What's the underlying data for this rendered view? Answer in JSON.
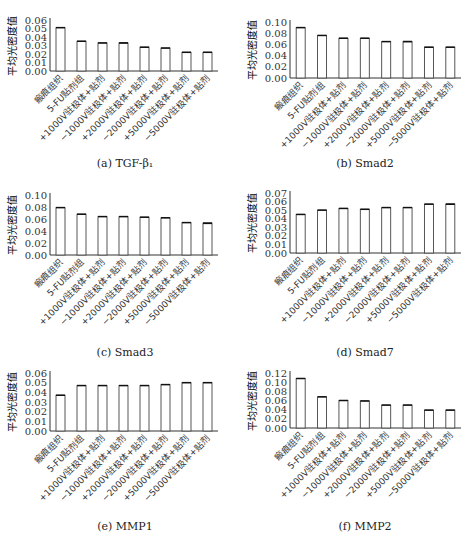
{
  "categories": [
    "瘢痕组织",
    "5-FU贴剂组",
    "+1000V驻极体+贴剂",
    "−1000V驻极体+贴剂",
    "+2000V驻极体+贴剂",
    "−2000V驻极体+贴剂",
    "+5000V驻极体+贴剂",
    "−5000V驻极体+贴剂"
  ],
  "ylabel": "平均光密度值",
  "captions": [
    "(a) TGF-β₁",
    "(b) Smad2",
    "(c) Smad3",
    "(d) Smad7",
    "(e) MMP1",
    "(f) MMP2"
  ],
  "chart_data": [
    {
      "type": "bar",
      "title": "(a) TGF-β1",
      "xlabel": "",
      "ylabel": "平均光密度值",
      "ylim": [
        0,
        0.06
      ],
      "yticks": [
        "0.00",
        "0.01",
        "0.02",
        "0.03",
        "0.04",
        "0.05",
        "0.06"
      ],
      "categories": [
        "瘢痕组织",
        "5-FU贴剂组",
        "+1000V驻极体+贴剂",
        "−1000V驻极体+贴剂",
        "+2000V驻极体+贴剂",
        "−2000V驻极体+贴剂",
        "+5000V驻极体+贴剂",
        "−5000V驻极体+贴剂"
      ],
      "values": [
        0.051,
        0.035,
        0.033,
        0.033,
        0.028,
        0.027,
        0.022,
        0.022
      ],
      "errors": [
        0.001,
        0.001,
        0.001,
        0.002,
        0.001,
        0.001,
        0.001,
        0.001
      ]
    },
    {
      "type": "bar",
      "title": "(b) Smad2",
      "xlabel": "",
      "ylabel": "平均光密度值",
      "ylim": [
        0,
        0.1
      ],
      "yticks": [
        "0.00",
        "0.02",
        "0.04",
        "0.06",
        "0.08",
        "0.10"
      ],
      "categories": [
        "瘢痕组织",
        "5-FU贴剂组",
        "+1000V驻极体+贴剂",
        "−1000V驻极体+贴剂",
        "+2000V驻极体+贴剂",
        "−2000V驻极体+贴剂",
        "+5000V驻极体+贴剂",
        "−5000V驻极体+贴剂"
      ],
      "values": [
        0.09,
        0.076,
        0.071,
        0.071,
        0.065,
        0.065,
        0.055,
        0.055
      ],
      "errors": [
        0.001,
        0.002,
        0.002,
        0.002,
        0.002,
        0.003,
        0.002,
        0.002
      ]
    },
    {
      "type": "bar",
      "title": "(c) Smad3",
      "xlabel": "",
      "ylabel": "平均光密度值",
      "ylim": [
        0,
        0.1
      ],
      "yticks": [
        "0.00",
        "0.02",
        "0.04",
        "0.06",
        "0.08",
        "0.10"
      ],
      "categories": [
        "瘢痕组织",
        "5-FU贴剂组",
        "+1000V驻极体+贴剂",
        "−1000V驻极体+贴剂",
        "+2000V驻极体+贴剂",
        "−2000V驻极体+贴剂",
        "+5000V驻极体+贴剂",
        "−5000V驻极体+贴剂"
      ],
      "values": [
        0.079,
        0.068,
        0.064,
        0.064,
        0.063,
        0.062,
        0.054,
        0.053
      ],
      "errors": [
        0.002,
        0.001,
        0.001,
        0.001,
        0.001,
        0.001,
        0.002,
        0.003
      ]
    },
    {
      "type": "bar",
      "title": "(d) Smad7",
      "xlabel": "",
      "ylabel": "平均光密度值",
      "ylim": [
        0,
        0.07
      ],
      "yticks": [
        "0.00",
        "0.01",
        "0.02",
        "0.03",
        "0.04",
        "0.05",
        "0.06",
        "0.07"
      ],
      "categories": [
        "瘢痕组织",
        "5-FU贴剂组",
        "+1000V驻极体+贴剂",
        "−1000V驻极体+贴剂",
        "+2000V驻极体+贴剂",
        "−2000V驻极体+贴剂",
        "+5000V驻极体+贴剂",
        "−5000V驻极体+贴剂"
      ],
      "values": [
        0.045,
        0.05,
        0.052,
        0.051,
        0.053,
        0.053,
        0.057,
        0.057
      ],
      "errors": [
        0.001,
        0.001,
        0.001,
        0.001,
        0.001,
        0.001,
        0.001,
        0.002
      ]
    },
    {
      "type": "bar",
      "title": "(e) MMP1",
      "xlabel": "",
      "ylabel": "平均光密度值",
      "ylim": [
        0,
        0.06
      ],
      "yticks": [
        "0.00",
        "0.01",
        "0.02",
        "0.03",
        "0.04",
        "0.05",
        "0.06"
      ],
      "categories": [
        "瘢痕组织",
        "5-FU贴剂组",
        "+1000V驻极体+贴剂",
        "−1000V驻极体+贴剂",
        "+2000V驻极体+贴剂",
        "−2000V驻极体+贴剂",
        "+5000V驻极体+贴剂",
        "−5000V驻极体+贴剂"
      ],
      "values": [
        0.037,
        0.047,
        0.047,
        0.047,
        0.047,
        0.048,
        0.05,
        0.05
      ],
      "errors": [
        0.001,
        0.001,
        0.001,
        0.001,
        0.001,
        0.001,
        0.001,
        0.001
      ]
    },
    {
      "type": "bar",
      "title": "(f) MMP2",
      "xlabel": "",
      "ylabel": "平均光密度值",
      "ylim": [
        0,
        0.12
      ],
      "yticks": [
        "0.00",
        "0.02",
        "0.04",
        "0.06",
        "0.08",
        "0.10",
        "0.12"
      ],
      "categories": [
        "瘢痕组织",
        "5-FU贴剂组",
        "+1000V驻极体+贴剂",
        "−1000V驻极体+贴剂",
        "+2000V驻极体+贴剂",
        "−2000V驻极体+贴剂",
        "+5000V驻极体+贴剂",
        "−5000V驻极体+贴剂"
      ],
      "values": [
        0.108,
        0.068,
        0.06,
        0.059,
        0.05,
        0.05,
        0.039,
        0.039
      ],
      "errors": [
        0.003,
        0.001,
        0.001,
        0.001,
        0.001,
        0.001,
        0.001,
        0.001
      ]
    }
  ]
}
